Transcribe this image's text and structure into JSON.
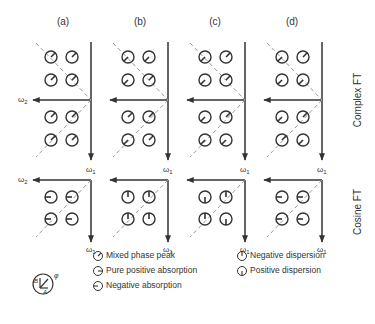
{
  "figure": {
    "columns": [
      {
        "label": "(a)"
      },
      {
        "label": "(b)"
      },
      {
        "label": "(c)"
      },
      {
        "label": "(d)"
      }
    ],
    "axis_labels": {
      "w1": "ω",
      "w1_sub": "1",
      "w2": "ω",
      "w2_sub": "2"
    },
    "row_labels": {
      "complex": "Complex FT",
      "cosine": "Cosine FT"
    },
    "complex_upper_angles": [
      [
        45,
        45,
        45,
        45
      ],
      [
        225,
        225,
        225,
        45
      ],
      [
        225,
        45,
        225,
        45
      ],
      [
        225,
        45,
        225,
        225
      ]
    ],
    "complex_lower_angles": [
      [
        45,
        45,
        45,
        45
      ],
      [
        45,
        45,
        225,
        45
      ],
      [
        225,
        45,
        225,
        225
      ],
      [
        225,
        45,
        45,
        225
      ]
    ],
    "cosine_angles": [
      [
        270,
        270,
        270,
        270
      ],
      [
        0,
        0,
        0,
        0
      ],
      [
        180,
        0,
        0,
        180
      ],
      [
        270,
        270,
        270,
        270
      ]
    ]
  },
  "legend": {
    "phase_symbol": {
      "B": "B",
      "A": "A",
      "phi": "φ"
    },
    "items": [
      {
        "label": "Mixed phase peak",
        "icon": "mixed-phase-icon"
      },
      {
        "label": "Pure positive absorption",
        "icon": "positive-absorption-icon"
      },
      {
        "label": "Negative absorption",
        "icon": "negative-absorption-icon"
      },
      {
        "label": "Negative dispersion",
        "icon": "negative-dispersion-icon"
      },
      {
        "label": "Positive dispersion",
        "icon": "positive-dispersion-icon"
      }
    ]
  }
}
